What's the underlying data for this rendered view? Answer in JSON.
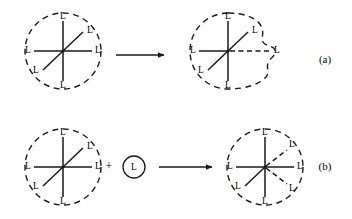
{
  "figure": {
    "background_color": "#ffffff",
    "ink_color": "#1a1a1a",
    "ligand_symbol": "L",
    "plus_symbol": "+",
    "rows": [
      {
        "tag": "(a)",
        "tag_x": 325,
        "tag_y": 60,
        "mechanism": "dissociative",
        "reactant": {
          "center_x": 63,
          "center_y": 51,
          "boundary": "dashed-circle",
          "radius": 38,
          "coordination_number": 6,
          "bonds": [
            {
              "direction": "up",
              "angle_deg": 270,
              "length": 30,
              "style": "solid",
              "label": "L",
              "label_x": 63,
              "label_y": 17
            },
            {
              "direction": "down",
              "angle_deg": 90,
              "length": 30,
              "style": "solid",
              "label": "L",
              "label_x": 63,
              "label_y": 86
            },
            {
              "direction": "left",
              "angle_deg": 180,
              "length": 29,
              "style": "solid",
              "label": "L",
              "label_x": 28,
              "label_y": 51
            },
            {
              "direction": "right",
              "angle_deg": 0,
              "length": 29,
              "style": "solid",
              "label": "L",
              "label_x": 98,
              "label_y": 51
            },
            {
              "direction": "upper-right",
              "angle_deg": 316,
              "length": 28,
              "style": "solid",
              "label": "L",
              "label_x": 90,
              "label_y": 31
            },
            {
              "direction": "lower-left",
              "angle_deg": 136,
              "length": 28,
              "style": "solid",
              "label": "L",
              "label_x": 36,
              "label_y": 71
            }
          ]
        },
        "arrow": {
          "x1": 116,
          "y1": 55,
          "x2": 166,
          "y2": 55,
          "style": "solid-single-head"
        },
        "product": {
          "center_x": 228,
          "center_y": 51,
          "boundary": "dashed-distorted-bulging-right",
          "radius": 38,
          "coordination_number": 6,
          "note": "one metal-ligand bond elongated and drawn dashed; boundary bulges outward around it",
          "bonds": [
            {
              "direction": "up",
              "angle_deg": 270,
              "length": 30,
              "style": "solid",
              "label": "L",
              "label_x": 228,
              "label_y": 17
            },
            {
              "direction": "down",
              "angle_deg": 90,
              "length": 30,
              "style": "solid",
              "label": "L",
              "label_x": 228,
              "label_y": 86
            },
            {
              "direction": "left",
              "angle_deg": 180,
              "length": 29,
              "style": "solid",
              "label": "L",
              "label_x": 193,
              "label_y": 51
            },
            {
              "direction": "right",
              "angle_deg": 0,
              "length": 42,
              "style": "dashed",
              "label": "L",
              "label_x": 277,
              "label_y": 51
            },
            {
              "direction": "upper-right",
              "angle_deg": 316,
              "length": 28,
              "style": "solid",
              "label": "L",
              "label_x": 255,
              "label_y": 31
            },
            {
              "direction": "lower-left",
              "angle_deg": 136,
              "length": 28,
              "style": "solid",
              "label": "L",
              "label_x": 201,
              "label_y": 71
            }
          ]
        }
      },
      {
        "tag": "(b)",
        "tag_x": 325,
        "tag_y": 167,
        "mechanism": "associative",
        "reactant": {
          "center_x": 63,
          "center_y": 167,
          "boundary": "dashed-circle",
          "radius": 38,
          "coordination_number": 6,
          "bonds": [
            {
              "direction": "up",
              "angle_deg": 270,
              "length": 30,
              "style": "solid",
              "label": "L",
              "label_x": 63,
              "label_y": 133
            },
            {
              "direction": "down",
              "angle_deg": 90,
              "length": 30,
              "style": "solid",
              "label": "L",
              "label_x": 63,
              "label_y": 202
            },
            {
              "direction": "left",
              "angle_deg": 180,
              "length": 29,
              "style": "solid",
              "label": "L",
              "label_x": 28,
              "label_y": 167
            },
            {
              "direction": "right",
              "angle_deg": 0,
              "length": 29,
              "style": "solid",
              "label": "L",
              "label_x": 98,
              "label_y": 167
            },
            {
              "direction": "upper-right",
              "angle_deg": 316,
              "length": 28,
              "style": "solid",
              "label": "L",
              "label_x": 90,
              "label_y": 147
            },
            {
              "direction": "lower-left",
              "angle_deg": 136,
              "length": 28,
              "style": "solid",
              "label": "L",
              "label_x": 36,
              "label_y": 187
            }
          ]
        },
        "plus": {
          "x": 109,
          "y": 167
        },
        "incoming_ligand": {
          "center_x": 134,
          "center_y": 167,
          "radius": 11,
          "boundary": "solid-circle",
          "label": "L"
        },
        "arrow": {
          "x1": 159,
          "y1": 167,
          "x2": 214,
          "y2": 167,
          "style": "solid-single-head"
        },
        "product": {
          "center_x": 265,
          "center_y": 167,
          "boundary": "dashed-circle",
          "radius": 38,
          "coordination_number": 7,
          "note": "seventh ligand added; the two right-hand diagonal bonds drawn dashed (partial bonds)",
          "bonds": [
            {
              "direction": "up",
              "angle_deg": 270,
              "length": 30,
              "style": "solid",
              "label": "L",
              "label_x": 265,
              "label_y": 133
            },
            {
              "direction": "down",
              "angle_deg": 90,
              "length": 30,
              "style": "solid",
              "label": "L",
              "label_x": 265,
              "label_y": 202
            },
            {
              "direction": "left",
              "angle_deg": 180,
              "length": 29,
              "style": "solid",
              "label": "L",
              "label_x": 230,
              "label_y": 167
            },
            {
              "direction": "right",
              "angle_deg": 0,
              "length": 29,
              "style": "solid",
              "label": "L",
              "label_x": 300,
              "label_y": 167
            },
            {
              "direction": "upper-right",
              "angle_deg": 320,
              "length": 28,
              "style": "dashed",
              "label": "L",
              "label_x": 292,
              "label_y": 145
            },
            {
              "direction": "lower-right",
              "angle_deg": 40,
              "length": 28,
              "style": "dashed",
              "label": "L",
              "label_x": 292,
              "label_y": 189
            },
            {
              "direction": "lower-left",
              "angle_deg": 136,
              "length": 28,
              "style": "solid",
              "label": "L",
              "label_x": 238,
              "label_y": 187
            }
          ]
        }
      }
    ]
  }
}
